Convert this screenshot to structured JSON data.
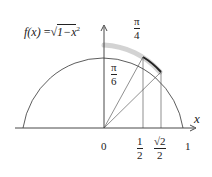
{
  "diagram": {
    "function_label": "f(x) = √(1−x²)",
    "function_label_parts": {
      "f": "f",
      "paren_x": "(x)",
      "eq": "=",
      "sqrt": "√",
      "radicand": "1−x",
      "exp": "2"
    },
    "axis_x_label": "x",
    "origin_label": "0",
    "tick_one_label": "1",
    "tick_half": {
      "num": "1",
      "den": "2"
    },
    "tick_sqrt2_half": {
      "num": "√2",
      "den": "2"
    },
    "angle_pi_4": {
      "num": "π",
      "den": "4"
    },
    "angle_pi_6": {
      "num": "π",
      "den": "6"
    },
    "colors": {
      "stroke": "#333333",
      "highlight": "#bfbfbf",
      "arc_bold": "#222222"
    }
  }
}
